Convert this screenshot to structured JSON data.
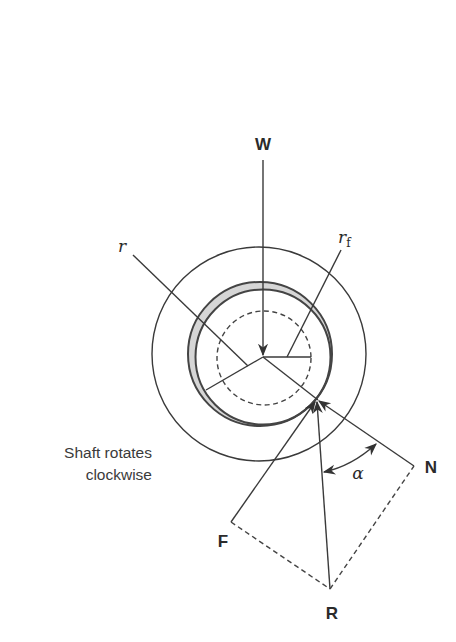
{
  "figure": {
    "type": "journal bearing friction circle force diagram",
    "labels": {
      "load": "W",
      "journal_radius": "r",
      "friction_circle_radius": "r",
      "friction_circle_radius_subscript": "f",
      "friction_force": "F",
      "resultant": "R",
      "normal_force": "N",
      "angle": "α"
    },
    "note": {
      "line1": "Shaft rotates",
      "line2": "clockwise"
    },
    "colors": {
      "line": "#3a3a3a",
      "crescent_fill": "#d6d6d6",
      "background": "#ffffff"
    }
  }
}
